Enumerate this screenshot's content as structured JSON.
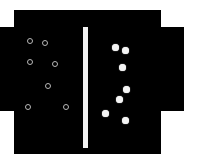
{
  "diagram": {
    "title": "",
    "colors": {
      "background": "#ffffff",
      "container": "#000000",
      "barrier": "#f2f2f2",
      "hollow_particle": "#b8b8b8",
      "filled_particle": "#f4f4f4"
    },
    "container": {
      "main": {
        "x": 14,
        "y": 10,
        "w": 147,
        "h": 144
      },
      "left_wing": {
        "x": 0,
        "y": 27,
        "w": 14,
        "h": 84
      },
      "right_wing": {
        "x": 161,
        "y": 27,
        "w": 23,
        "h": 84
      }
    },
    "barrier": {
      "x": 83,
      "y": 27,
      "w": 5,
      "h": 121
    },
    "left_chamber": {
      "particle_type": "hollow",
      "count": 7,
      "particles": [
        {
          "x": 30,
          "y": 41
        },
        {
          "x": 45,
          "y": 43
        },
        {
          "x": 30,
          "y": 62
        },
        {
          "x": 55,
          "y": 64
        },
        {
          "x": 48,
          "y": 86
        },
        {
          "x": 28,
          "y": 107
        },
        {
          "x": 66,
          "y": 107
        }
      ]
    },
    "right_chamber": {
      "particle_type": "filled",
      "count": 7,
      "particles": [
        {
          "x": 115,
          "y": 47
        },
        {
          "x": 125,
          "y": 50
        },
        {
          "x": 122,
          "y": 67
        },
        {
          "x": 126,
          "y": 89
        },
        {
          "x": 119,
          "y": 99
        },
        {
          "x": 105,
          "y": 113
        },
        {
          "x": 125,
          "y": 120
        }
      ]
    }
  }
}
